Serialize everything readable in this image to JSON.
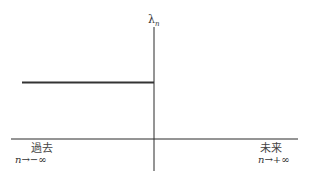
{
  "diagram": {
    "y_axis_label": "λ",
    "y_axis_label_subscript": "n",
    "left_region": {
      "title": "過去",
      "limit_var": "n",
      "limit_arrow": "→",
      "limit_value": "−∞"
    },
    "right_region": {
      "title": "未来",
      "limit_var": "n",
      "limit_arrow": "→",
      "limit_value": "+∞"
    },
    "colors": {
      "axis": "#2a2a2a",
      "line": "#333333"
    }
  }
}
